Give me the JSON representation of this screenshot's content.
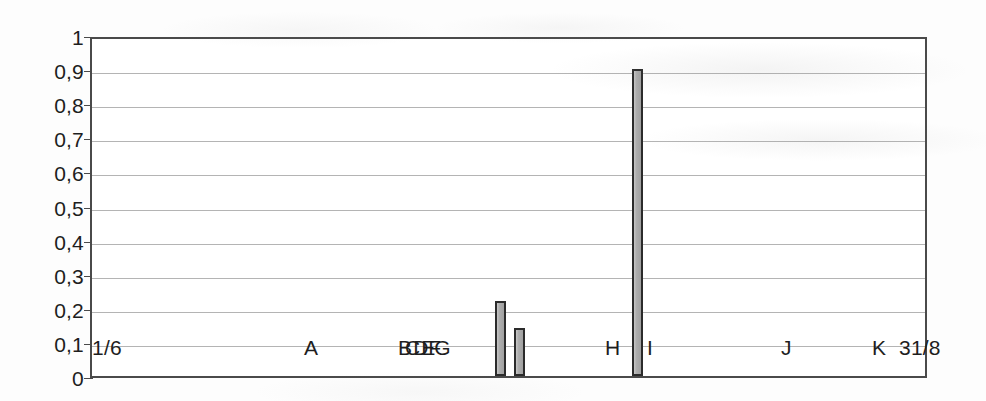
{
  "chart_data": {
    "type": "bar",
    "title": "",
    "subtitle": "",
    "xlabel": "",
    "ylabel": "",
    "ylim": [
      0,
      1
    ],
    "ytick_labels": [
      "1",
      "0,9",
      "0,8",
      "0,7",
      "0,6",
      "0,5",
      "0,4",
      "0,3",
      "0,2",
      "0,1",
      "0"
    ],
    "ytick_values": [
      1,
      0.9,
      0.8,
      0.7,
      0.6,
      0.5,
      0.4,
      0.3,
      0.2,
      0.1,
      0
    ],
    "grid": true,
    "grid_axis": "y",
    "legend": "none",
    "decimal_separator": ",",
    "x_axis_type": "date-span",
    "x_range_start_label": "1/6",
    "x_range_end_label": "31/8",
    "bars": [
      {
        "label": "bar-1",
        "value": 0.22,
        "x_pos_px": 493,
        "width_px": 11
      },
      {
        "label": "bar-2",
        "value": 0.14,
        "x_pos_px": 512,
        "width_px": 11
      },
      {
        "label": "bar-3",
        "value": 0.9,
        "x_pos_px": 630,
        "width_px": 11
      }
    ],
    "values": [
      0.22,
      0.14,
      0.9
    ],
    "categories": [
      "bar-1",
      "bar-2",
      "bar-3"
    ],
    "event_markers": [
      {
        "label": "1/6",
        "x_pos_px": 92
      },
      {
        "label": "A",
        "x_pos_px": 304
      },
      {
        "label": "BCDEFG",
        "x_pos_px": 398
      },
      {
        "label": "H",
        "x_pos_px": 605
      },
      {
        "label": "I",
        "x_pos_px": 647
      },
      {
        "label": "J",
        "x_pos_px": 781
      },
      {
        "label": "K",
        "x_pos_px": 872
      },
      {
        "label": "31/8",
        "x_pos_px": 899
      }
    ],
    "colors": {
      "bar_fill": "#a9a9a9",
      "bar_border": "#2b2b2b",
      "gridline": "#b4b4b4",
      "axis": "#4a4a4a",
      "text": "#1e1e1e",
      "background": "#ffffff"
    }
  }
}
